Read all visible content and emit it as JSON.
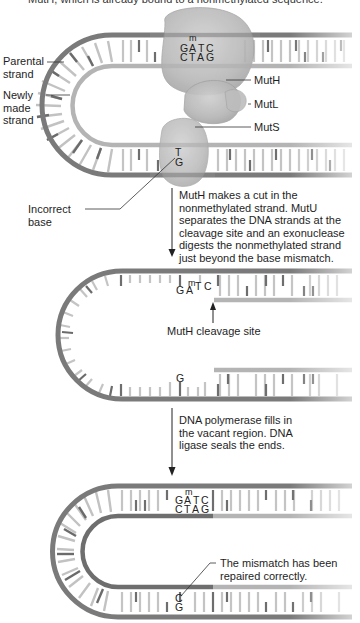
{
  "header": {
    "top_text_cutoff": "MutH, which is already bound to a nonmethylated sequence."
  },
  "panel1": {
    "labels": {
      "parental_strand": "Parental\nstrand",
      "newly_made_strand": "Newly\nmade\nstrand",
      "muth": "MutH",
      "mutl": "MutL",
      "muts": "MutS",
      "incorrect_base": "Incorrect\nbase"
    },
    "sequence_top": [
      "G",
      "A",
      "T",
      "C"
    ],
    "sequence_bottom": [
      "C",
      "T",
      "A",
      "G"
    ],
    "methyl_mark": "m",
    "mismatch_top": "T",
    "mismatch_bottom": "G"
  },
  "step1": {
    "caption": "MutH makes a cut in the\nnonmethylated strand. MutU\nseparates the DNA strands at the\ncleavage site and an exonuclease\ndigests the nonmethylated strand\njust beyond the base mismatch."
  },
  "panel2": {
    "sequence_top": [
      "G",
      "A",
      "T",
      "C"
    ],
    "methyl_mark": "m",
    "cleavage_label": "MutH cleavage site",
    "remaining_base": "G"
  },
  "step2": {
    "caption": "DNA polymerase fills in\nthe vacant region. DNA\nligase seals the ends."
  },
  "panel3": {
    "sequence_top": [
      "G",
      "A",
      "T",
      "C"
    ],
    "sequence_bottom": [
      "C",
      "T",
      "A",
      "G"
    ],
    "methyl_mark": "m",
    "repaired_top": "C",
    "repaired_bottom": "G",
    "repaired_label": "The mismatch has been\nrepaired correctly."
  },
  "colors": {
    "parental_strand": "#7a7a7a",
    "new_strand": "#b4b4b4",
    "repaired_strand": "#6e6e6e",
    "rung_dark": "#6b6b6b",
    "rung_light": "#c2c2c2",
    "protein": "#b9b9b9",
    "protein_edge": "#9a9a9a"
  }
}
